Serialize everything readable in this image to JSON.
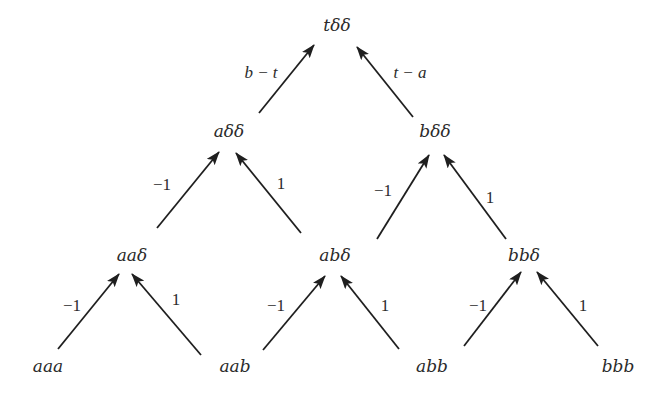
{
  "diagram": {
    "type": "tree",
    "line_color": "#1f1f1f",
    "text_color": "#2b2b2b",
    "nodes": [
      {
        "id": "tdd",
        "label": "tδδ",
        "x": 337,
        "y": 31
      },
      {
        "id": "add",
        "label": "aδδ",
        "x": 229,
        "y": 137
      },
      {
        "id": "bdd",
        "label": "bδδ",
        "x": 435,
        "y": 137
      },
      {
        "id": "aad",
        "label": "aaδ",
        "x": 132,
        "y": 261
      },
      {
        "id": "abd",
        "label": "abδ",
        "x": 335,
        "y": 261
      },
      {
        "id": "bbd",
        "label": "bbδ",
        "x": 524,
        "y": 261
      },
      {
        "id": "aaa",
        "label": "aaa",
        "x": 48,
        "y": 372
      },
      {
        "id": "aab",
        "label": "aab",
        "x": 235,
        "y": 372
      },
      {
        "id": "abb",
        "label": "abb",
        "x": 432,
        "y": 372
      },
      {
        "id": "bbb",
        "label": "bbb",
        "x": 618,
        "y": 372
      }
    ],
    "edges": [
      {
        "from": "add",
        "to": "tdd",
        "label": "b − t",
        "italic": true,
        "x1": 259,
        "y1": 113,
        "x2": 314,
        "y2": 45,
        "lx": 261,
        "ly": 78
      },
      {
        "from": "bdd",
        "to": "tdd",
        "label": "t − a",
        "italic": true,
        "x1": 413,
        "y1": 117,
        "x2": 357,
        "y2": 47,
        "lx": 410,
        "ly": 78
      },
      {
        "from": "aad",
        "to": "add",
        "label": "−1",
        "italic": false,
        "x1": 157,
        "y1": 228,
        "x2": 219,
        "y2": 152,
        "lx": 162,
        "ly": 190
      },
      {
        "from": "abd",
        "to": "add",
        "label": "1",
        "italic": false,
        "x1": 301,
        "y1": 233,
        "x2": 236,
        "y2": 153,
        "lx": 281,
        "ly": 189
      },
      {
        "from": "abd",
        "to": "bdd",
        "label": "−1",
        "italic": false,
        "x1": 377,
        "y1": 239,
        "x2": 429,
        "y2": 155,
        "lx": 383,
        "ly": 196
      },
      {
        "from": "bbd",
        "to": "bdd",
        "label": "1",
        "italic": false,
        "x1": 506,
        "y1": 239,
        "x2": 444,
        "y2": 155,
        "lx": 490,
        "ly": 203
      },
      {
        "from": "aaa",
        "to": "aad",
        "label": "−1",
        "italic": false,
        "x1": 58,
        "y1": 349,
        "x2": 119,
        "y2": 274,
        "lx": 72,
        "ly": 311
      },
      {
        "from": "aab",
        "to": "aad",
        "label": "1",
        "italic": false,
        "x1": 201,
        "y1": 355,
        "x2": 132,
        "y2": 274,
        "lx": 176,
        "ly": 305
      },
      {
        "from": "abb",
        "to": "abd",
        "label": "−1",
        "italic": false,
        "x1": 263,
        "y1": 350,
        "x2": 325,
        "y2": 276,
        "lx": 276,
        "ly": 311
      },
      {
        "from": "abb",
        "to": "abd",
        "label": "1",
        "italic": false,
        "x1": 399,
        "y1": 349,
        "x2": 341,
        "y2": 276,
        "lx": 385,
        "ly": 311
      },
      {
        "from": "bbb",
        "to": "bbd",
        "label": "−1",
        "italic": false,
        "x1": 464,
        "y1": 346,
        "x2": 521,
        "y2": 272,
        "lx": 478,
        "ly": 311
      },
      {
        "from": "bbb",
        "to": "bbd",
        "label": "1",
        "italic": false,
        "x1": 598,
        "y1": 346,
        "x2": 537,
        "y2": 272,
        "lx": 583,
        "ly": 311
      }
    ]
  }
}
